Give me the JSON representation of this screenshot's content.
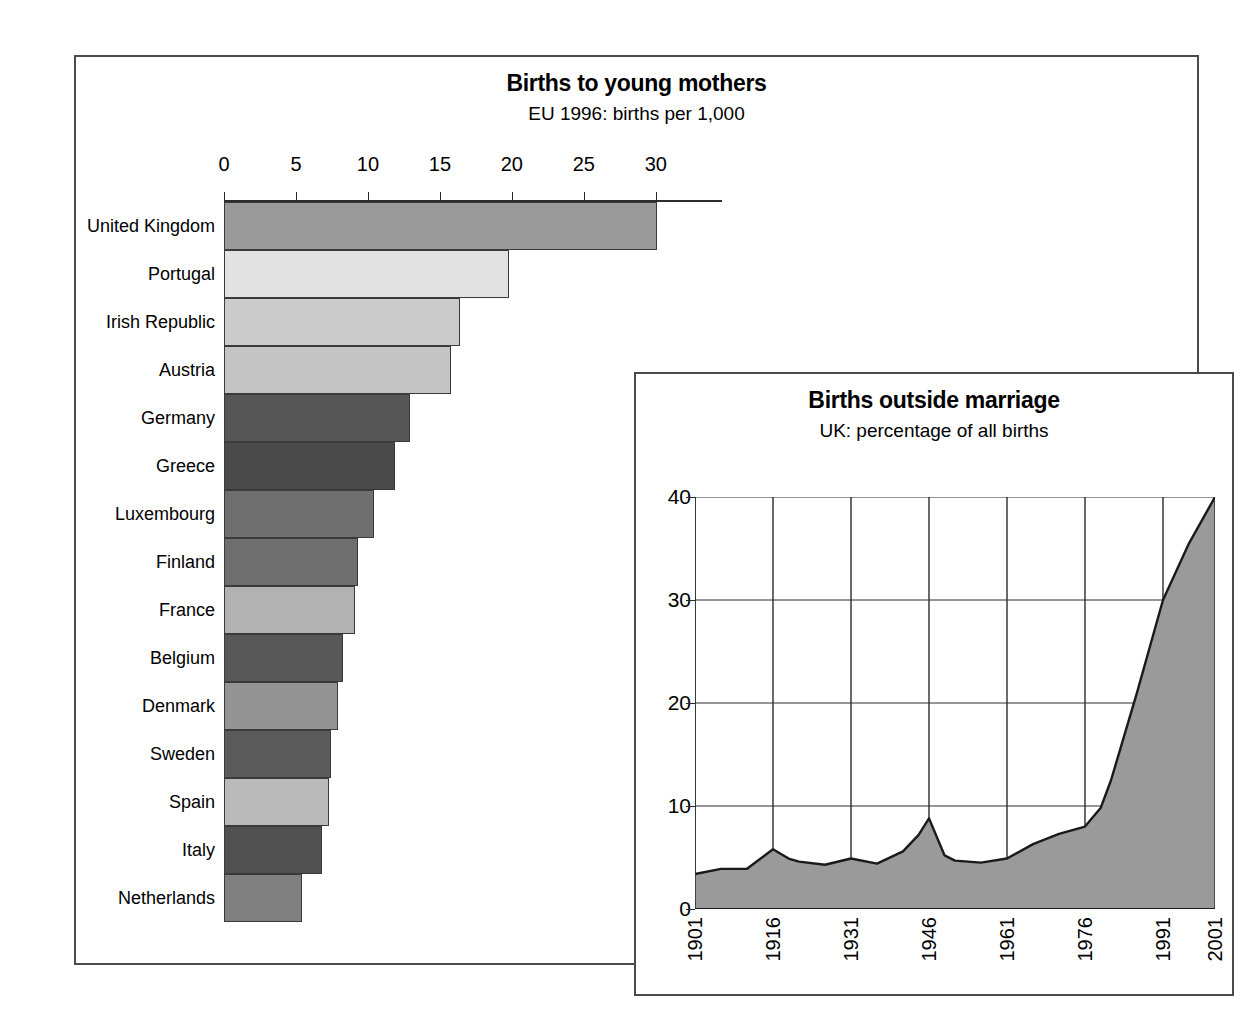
{
  "chart_data": [
    {
      "type": "bar",
      "orientation": "horizontal",
      "title": "Births to young mothers",
      "subtitle": "EU 1996: births per 1,000",
      "xlabel": "",
      "ylabel": "",
      "xlim": [
        0,
        34.6
      ],
      "ticks": [
        0,
        5,
        10,
        15,
        20,
        25,
        30
      ],
      "tick_labels": [
        "0",
        "5",
        "10",
        "15",
        "20",
        "25",
        "30"
      ],
      "grid": false,
      "legend": "none",
      "categories": [
        "United Kingdom",
        "Portugal",
        "Irish Republic",
        "Austria",
        "Germany",
        "Greece",
        "Luxembourg",
        "Finland",
        "France",
        "Belgium",
        "Denmark",
        "Sweden",
        "Spain",
        "Italy",
        "Netherlands"
      ],
      "values": [
        30.1,
        19.8,
        16.4,
        15.8,
        12.9,
        11.9,
        10.4,
        9.3,
        9.1,
        8.3,
        7.9,
        7.4,
        7.3,
        6.8,
        5.4
      ],
      "bar_colors": [
        "#9a9a9a",
        "#e2e2e2",
        "#cccccc",
        "#c4c4c4",
        "#565656",
        "#4a4a4a",
        "#6f6f6f",
        "#6e6e6e",
        "#b2b2b2",
        "#585858",
        "#949494",
        "#5b5b5b",
        "#b9b9b9",
        "#505050",
        "#808080"
      ]
    },
    {
      "type": "area",
      "title": "Births outside marriage",
      "subtitle": "UK: percentage of all births",
      "xlabel": "",
      "ylabel": "",
      "ylim": [
        0,
        40
      ],
      "xlim": [
        1901,
        2001
      ],
      "yticks": [
        0,
        10,
        20,
        30,
        40
      ],
      "ytick_labels": [
        "0",
        "10",
        "20",
        "30",
        "40"
      ],
      "xticks": [
        1901,
        1916,
        1931,
        1946,
        1961,
        1976,
        1991,
        2001
      ],
      "xtick_labels": [
        "1901",
        "1916",
        "1931",
        "1946",
        "1961",
        "1976",
        "1991",
        "2001"
      ],
      "grid": true,
      "legend": "none",
      "fill_color": "#9a9a9a",
      "line_color": "#1a1a1a",
      "x": [
        1901,
        1906,
        1911,
        1916,
        1919,
        1921,
        1926,
        1931,
        1936,
        1941,
        1944,
        1946,
        1949,
        1951,
        1956,
        1961,
        1966,
        1971,
        1976,
        1979,
        1981,
        1986,
        1991,
        1996,
        2001
      ],
      "values": [
        3.4,
        3.9,
        3.9,
        5.8,
        4.9,
        4.6,
        4.3,
        4.9,
        4.4,
        5.6,
        7.2,
        8.8,
        5.2,
        4.7,
        4.5,
        4.9,
        6.3,
        7.3,
        8.0,
        9.8,
        12.5,
        21.0,
        30.0,
        35.5,
        40.0
      ]
    }
  ]
}
